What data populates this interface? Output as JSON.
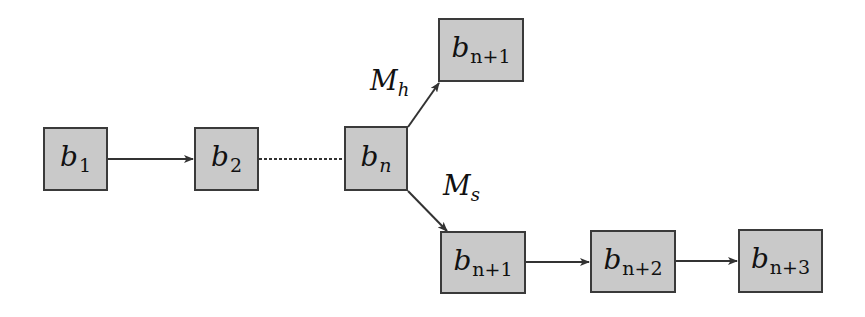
{
  "diagram": {
    "type": "block-chain-fork",
    "colors": {
      "block_fill": "#c9c9c9",
      "block_border": "#3a3a3a",
      "edge": "#333333",
      "background": "#ffffff"
    },
    "blocks": [
      {
        "id": "b1",
        "base": "b",
        "sub": "1",
        "x": 43,
        "y": 127,
        "w": 65,
        "h": 64
      },
      {
        "id": "b2",
        "base": "b",
        "sub": "2",
        "x": 194,
        "y": 127,
        "w": 65,
        "h": 64
      },
      {
        "id": "bn",
        "base": "b",
        "sub": "n",
        "x": 344,
        "y": 126,
        "w": 64,
        "h": 65
      },
      {
        "id": "bn1_top",
        "base": "b",
        "sub": "n+1",
        "x": 438,
        "y": 18,
        "w": 86,
        "h": 64
      },
      {
        "id": "bn1_bottom",
        "base": "b",
        "sub": "n+1",
        "x": 440,
        "y": 231,
        "w": 86,
        "h": 63
      },
      {
        "id": "bn2",
        "base": "b",
        "sub": "n+2",
        "x": 590,
        "y": 230,
        "w": 86,
        "h": 63
      },
      {
        "id": "bn3",
        "base": "b",
        "sub": "n+3",
        "x": 738,
        "y": 229,
        "w": 85,
        "h": 64
      }
    ],
    "edges": [
      {
        "from": "b1",
        "to": "b2",
        "style": "solid",
        "arrow": true
      },
      {
        "from": "b2",
        "to": "bn",
        "style": "dotted",
        "arrow": false
      },
      {
        "from": "bn",
        "to": "bn1_top",
        "style": "solid",
        "arrow": true,
        "label": "M_h"
      },
      {
        "from": "bn",
        "to": "bn1_bottom",
        "style": "solid",
        "arrow": true,
        "label": "M_s"
      },
      {
        "from": "bn1_bottom",
        "to": "bn2",
        "style": "solid",
        "arrow": true
      },
      {
        "from": "bn2",
        "to": "bn3",
        "style": "solid",
        "arrow": true
      }
    ],
    "edge_labels": {
      "mh": {
        "base": "M",
        "sub": "h"
      },
      "ms": {
        "base": "M",
        "sub": "s"
      }
    }
  }
}
